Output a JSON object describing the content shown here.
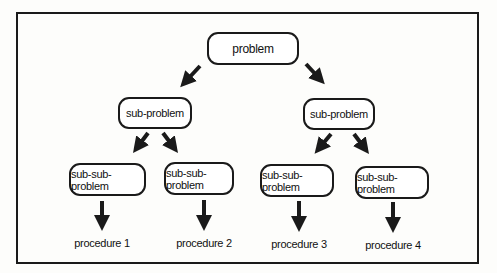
{
  "diagram": {
    "root": {
      "label": "problem"
    },
    "level1": [
      {
        "label": "sub-problem"
      },
      {
        "label": "sub-problem"
      }
    ],
    "level2": [
      {
        "label": "sub-sub-problem"
      },
      {
        "label": "sub-sub-problem"
      },
      {
        "label": "sub-sub-problem"
      },
      {
        "label": "sub-sub-problem"
      }
    ],
    "procedures": [
      {
        "label": "procedure 1"
      },
      {
        "label": "procedure 2"
      },
      {
        "label": "procedure 3"
      },
      {
        "label": "procedure 4"
      }
    ],
    "colors": {
      "stroke": "#1a1a1a",
      "background": "#fdfdfb"
    }
  }
}
